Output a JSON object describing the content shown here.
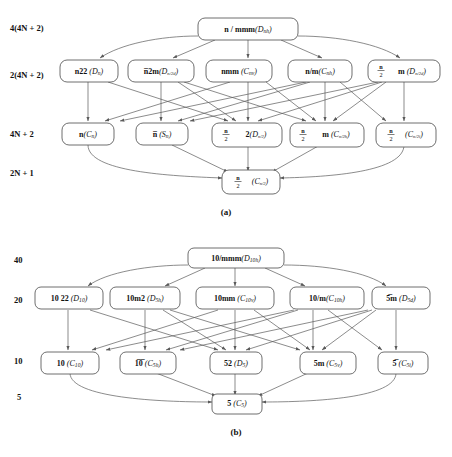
{
  "figure": {
    "caption_a": "(a)",
    "caption_b": "(b)",
    "panel_a": {
      "level_labels": [
        "4(4N + 2)",
        "2(4N + 2)",
        "4N + 2",
        "2N + 1"
      ],
      "nodes": {
        "top": {
          "id": "n-mmm",
          "main": "n / mmm",
          "sym": "D",
          "sub": "nh",
          "label": "n/mmm(Dnh)"
        },
        "r2c1": {
          "id": "n22",
          "main": "n22",
          "sym": "D",
          "sub": "n",
          "label": "n22 (Dn)"
        },
        "r2c2": {
          "id": "nbar2m",
          "main": "n̅2m",
          "sym": "D",
          "sub": "n/2 d",
          "label": "n̅2m(Dn/2 d)"
        },
        "r2c3": {
          "id": "nmm",
          "main": "nmm",
          "sym": "C",
          "sub": "nv",
          "label": "nmm (Cnv)"
        },
        "r2c4": {
          "id": "n-m",
          "main": "n/m",
          "sym": "C",
          "sub": "nh",
          "label": "n/m(Cnh)"
        },
        "r2c5": {
          "id": "nhalf-m",
          "main": "(n/2) m",
          "sym": "D",
          "sub": "n/2 d",
          "label": "(n/2)m (Dn/2 d)"
        },
        "r3c1": {
          "id": "n",
          "main": "n",
          "sym": "C",
          "sub": "n",
          "label": "n(Cn)"
        },
        "r3c2": {
          "id": "nbar",
          "main": "n̅",
          "sym": "S",
          "sub": "n",
          "label": "n̅ (Sn)"
        },
        "r3c3": {
          "id": "nhalf-2",
          "main": "(n/2) 2",
          "sym": "D",
          "sub": "n/2",
          "label": "(n/2)2(Dn/2)"
        },
        "r3c4": {
          "id": "nhalf-m2",
          "main": "(n/2) m",
          "sym": "C",
          "sub": "n/2 h",
          "label": "(n/2)m (Cn/2 h)"
        },
        "r3c5": {
          "id": "nhalf",
          "main": "(n/2)",
          "sym": "C",
          "sub": "n/2 i",
          "label": "(n/2)(Cn/2 i)"
        },
        "bot": {
          "id": "nhalf-c",
          "main": "(n/2)",
          "sym": "C",
          "sub": "n/2",
          "label": "(n/2)(Cn/2)"
        }
      }
    },
    "panel_b": {
      "level_labels": [
        "40",
        "20",
        "10",
        "5"
      ],
      "nodes": {
        "top": {
          "id": "10-mmm",
          "main": "10/mmm",
          "sym": "D",
          "sub": "10h",
          "label": "10/mmm(D10h)"
        },
        "r2c1": {
          "id": "1022",
          "main": "10 22",
          "sym": "D",
          "sub": "10",
          "label": "10 22 (D10)"
        },
        "r2c2": {
          "id": "10m2",
          "main": "10m2",
          "sym": "D",
          "sub": "5h",
          "label": "10m2 (D5h)"
        },
        "r2c3": {
          "id": "10mm",
          "main": "10mm",
          "sym": "C",
          "sub": "10v",
          "label": "10mm (C10v)"
        },
        "r2c4": {
          "id": "10-m",
          "main": "10/m",
          "sym": "C",
          "sub": "10h",
          "label": "10/m(C10h)"
        },
        "r2c5": {
          "id": "5barm",
          "main": "5̅m",
          "sym": "D",
          "sub": "5d",
          "label": "5̅m (D5d)"
        },
        "r3c1": {
          "id": "10",
          "main": "10",
          "sym": "C",
          "sub": "10",
          "label": "10 (C10)"
        },
        "r3c2": {
          "id": "10bar",
          "main": "1̅0̅",
          "sym": "C",
          "sub": "5h",
          "label": "10̅ (C5h)"
        },
        "r3c3": {
          "id": "52",
          "main": "52",
          "sym": "D",
          "sub": "5",
          "label": "52 (D5)"
        },
        "r3c4": {
          "id": "5m",
          "main": "5m",
          "sym": "C",
          "sub": "5v",
          "label": "5m (C5v)"
        },
        "r3c5": {
          "id": "5bar",
          "main": "5̅",
          "sym": "C",
          "sub": "5i",
          "label": "5̅ (C5i)"
        },
        "bot": {
          "id": "5",
          "main": "5",
          "sym": "C",
          "sub": "5",
          "label": "5 (C5)"
        }
      }
    },
    "colors": {
      "background": "#ffffff",
      "box_stroke": "#4a4a4a",
      "edge_stroke": "#5a5a5a",
      "text": "#111111"
    }
  }
}
